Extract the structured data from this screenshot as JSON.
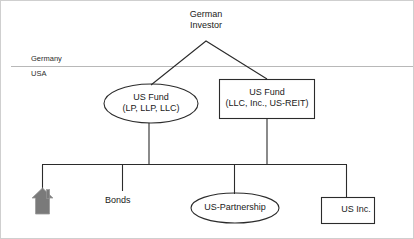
{
  "diagram": {
    "colors": {
      "stroke": "#2b2b2b",
      "divider": "#b8b8b8",
      "house_fill": "#7a7a7a",
      "text": "#1a1a1a",
      "background": "#ffffff"
    },
    "region_labels": [
      {
        "id": "germany",
        "label": "Germany"
      },
      {
        "id": "usa",
        "label": "USA"
      }
    ],
    "nodes": [
      {
        "id": "german-investor",
        "shape": "text",
        "line1": "German",
        "line2": "Investor",
        "text": "German Investor"
      },
      {
        "id": "us-fund-ellipse",
        "shape": "ellipse",
        "line1": "US Fund",
        "line2": "(LP, LLP, LLC)",
        "text": "US Fund (LP, LLP, LLC)"
      },
      {
        "id": "us-fund-box",
        "shape": "rectangle",
        "line1": "US Fund",
        "line2": "(LLC, Inc., US-REIT)",
        "text": "US Fund (LLC, Inc., US-REIT)"
      },
      {
        "id": "real-estate",
        "shape": "house-icon",
        "text": ""
      },
      {
        "id": "bonds",
        "shape": "text",
        "text": "Bonds"
      },
      {
        "id": "us-partnership",
        "shape": "ellipse",
        "text": "US-Partnership"
      },
      {
        "id": "us-inc",
        "shape": "rectangle",
        "text": "US Inc."
      }
    ],
    "icons": [
      {
        "id": "house-icon",
        "name": "house-icon"
      }
    ]
  }
}
